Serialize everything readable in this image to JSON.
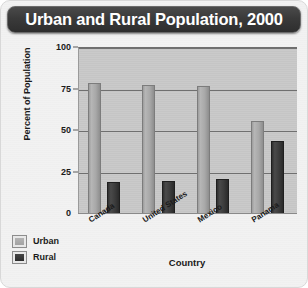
{
  "chart_data": {
    "type": "bar",
    "title": "Urban and Rural Population, 2000",
    "xlabel": "Country",
    "ylabel": "Percent of Population",
    "categories": [
      "Canada",
      "United States",
      "Mexico",
      "Panama"
    ],
    "series": [
      {
        "name": "Urban",
        "values": [
          79,
          78,
          77,
          56
        ],
        "color": "#a8a8a8"
      },
      {
        "name": "Rural",
        "values": [
          19,
          20,
          21,
          44
        ],
        "color": "#383838"
      }
    ],
    "ylim": [
      0,
      100
    ],
    "yticks": [
      0,
      25,
      50,
      75,
      100
    ],
    "ytick_labels": [
      "0",
      "25",
      "50",
      "75",
      "100"
    ],
    "grid": true,
    "legend_position": "bottom-left"
  },
  "legend": {
    "items": [
      {
        "label": "Urban"
      },
      {
        "label": "Rural"
      }
    ]
  },
  "theme": {
    "title_bar_bg": "#3a3a3a",
    "title_text_color": "#ffffff",
    "plot_bg": "#c9c9c9",
    "figure_bg": "#f2f2f2",
    "gridline_color": "#6f6f6f"
  }
}
